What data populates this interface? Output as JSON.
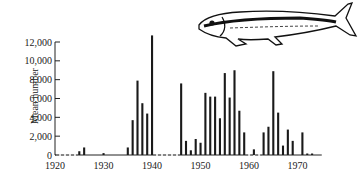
{
  "chart_data": {
    "type": "bar",
    "title": "",
    "xlabel": "",
    "ylabel": "Mean number",
    "ylim": [
      0,
      13000
    ],
    "xlim": [
      1920,
      1975
    ],
    "yticks": [
      0,
      2000,
      4000,
      6000,
      8000,
      10000,
      12000
    ],
    "ytick_labels": [
      "0",
      "2,000",
      "4,000",
      "6,000",
      "8,000",
      "10,000",
      "12,000"
    ],
    "xticks": [
      1920,
      1930,
      1940,
      1950,
      1960,
      1970
    ],
    "xtick_labels": [
      "1920",
      "1930",
      "1940",
      "1950",
      "1960",
      "1970"
    ],
    "grid": false,
    "legend": null,
    "x": [
      1925,
      1926,
      1930,
      1935,
      1936,
      1937,
      1938,
      1939,
      1940,
      1946,
      1947,
      1948,
      1949,
      1950,
      1951,
      1952,
      1953,
      1954,
      1955,
      1956,
      1957,
      1958,
      1959,
      1961,
      1963,
      1964,
      1965,
      1966,
      1967,
      1968,
      1969,
      1971,
      1972,
      1973
    ],
    "values": [
      400,
      800,
      200,
      800,
      3700,
      7900,
      5500,
      4400,
      12700,
      7600,
      1500,
      500,
      1700,
      1300,
      6600,
      6200,
      6200,
      3900,
      8700,
      6100,
      9000,
      4700,
      2400,
      600,
      2400,
      3000,
      8900,
      4500,
      1000,
      2700,
      1500,
      2400,
      100,
      100
    ],
    "annotations": [
      "fish illustration (herring-like) at top right"
    ],
    "baseline_dashed_segments": [
      [
        1920,
        1925
      ],
      [
        1940,
        1946
      ],
      [
        1959,
        1963
      ]
    ]
  },
  "axis": {
    "ylabel": "Mean number"
  }
}
